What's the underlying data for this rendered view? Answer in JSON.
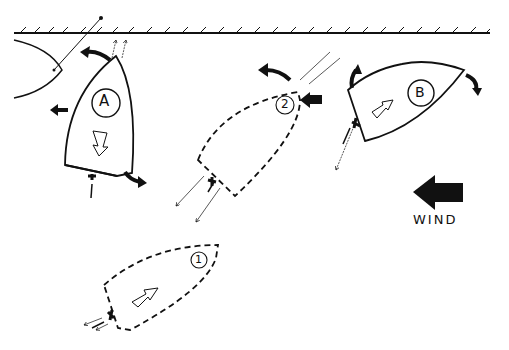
{
  "diagram": {
    "labels": {
      "boat_a": "A",
      "boat_b": "B",
      "position_1": "1",
      "position_2": "2",
      "wind": "WIND"
    },
    "colors": {
      "ink": "#111111",
      "background": "#ffffff"
    }
  }
}
